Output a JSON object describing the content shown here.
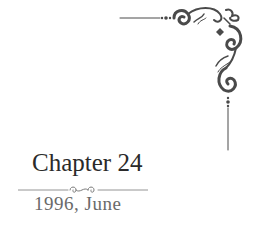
{
  "chapter": {
    "title": "Chapter 24",
    "date": "1996, June"
  },
  "decorations": {
    "corner_ornament": "corner-flourish-icon",
    "divider_ornament": "scroll-divider-icon"
  },
  "colors": {
    "ornament": "#4a4a4a",
    "title_text": "#2a2a2a",
    "date_text": "#6a6a6a",
    "background": "#ffffff"
  }
}
